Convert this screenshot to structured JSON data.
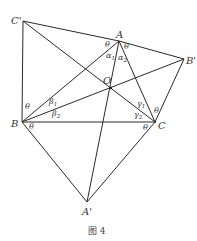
{
  "figure": {
    "caption": "图 4",
    "points": {
      "C_prime": {
        "label": "C'",
        "x": 23,
        "y": 21
      },
      "A": {
        "label": "A",
        "x": 119,
        "y": 41
      },
      "B_prime": {
        "label": "B'",
        "x": 184,
        "y": 59
      },
      "O": {
        "label": "O",
        "x": 111,
        "y": 88
      },
      "B": {
        "label": "B",
        "x": 22,
        "y": 122
      },
      "C": {
        "label": "C",
        "x": 155,
        "y": 122
      },
      "A_prime": {
        "label": "A'",
        "x": 87,
        "y": 202
      }
    },
    "angle_labels": {
      "theta": "θ",
      "alpha": "α",
      "beta": "β",
      "gamma": "γ",
      "sub1": "1",
      "sub2": "2"
    }
  }
}
